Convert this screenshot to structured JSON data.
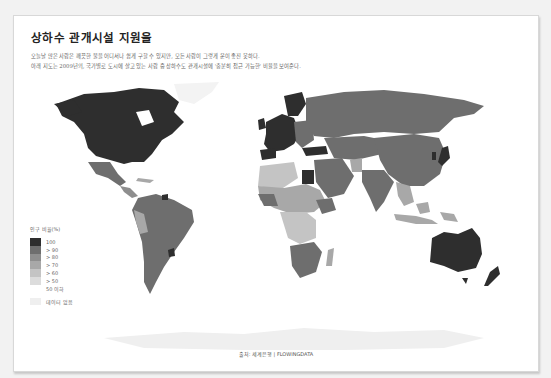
{
  "header": {
    "title": "상하수 관개시설 지원율",
    "description_lines": [
      "오늘날 많은 사람은 깨끗한 물을 어디서나 쉽게 구할 수 있지만, 모든 사람이 그렇게 운이 좋진 못하다.",
      "아래 지도는 2009년의, 국가별로 도시에 살고 있는 사람 중 상하수도 관개시설에 '충분히 접근 가능한' 비율을 보여준다."
    ]
  },
  "legend": {
    "title": "인구 비율(%)",
    "items": [
      {
        "label": "100",
        "color": "#2e2e2e"
      },
      {
        "label": "> 90",
        "color": "#6e6e6e"
      },
      {
        "label": "> 80",
        "color": "#8e8e8e"
      },
      {
        "label": "> 70",
        "color": "#a8a8a8"
      },
      {
        "label": "> 60",
        "color": "#c4c4c4"
      },
      {
        "label": "> 50",
        "color": "#dcdcdc"
      },
      {
        "label": "50 이하",
        "color": "#ffffff"
      }
    ],
    "no_data": {
      "label": "데이터 없음",
      "color": "#efefef"
    }
  },
  "footer": {
    "source": "출처: 세계은행 | FLOWINGDATA"
  },
  "colors": {
    "background": "#f2f2f2",
    "card": "#ffffff",
    "c100": "#2e2e2e",
    "c90": "#6e6e6e",
    "c80": "#8e8e8e",
    "c70": "#a8a8a8",
    "c60": "#c4c4c4",
    "c50": "#dcdcdc",
    "nodata": "#efefef"
  }
}
